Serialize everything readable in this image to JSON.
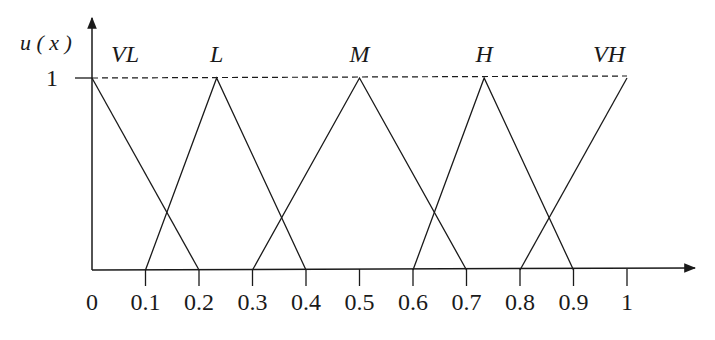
{
  "chart_data": {
    "type": "line",
    "title": "",
    "xlabel": "",
    "ylabel": "u ( x )",
    "xlim": [
      0,
      1
    ],
    "ylim": [
      0,
      1
    ],
    "grid": false,
    "legend": "none (labels placed above each peak)",
    "x_ticks": [
      "0",
      "0.1",
      "0.2",
      "0.3",
      "0.4",
      "0.5",
      "0.6",
      "0.7",
      "0.8",
      "0.9",
      "1"
    ],
    "y_ticks": [
      "1"
    ],
    "reference_line": {
      "y": 1,
      "style": "dashed",
      "x_range": [
        0,
        1
      ]
    },
    "series": [
      {
        "name": "VL",
        "x": [
          0,
          0.2
        ],
        "y": [
          1,
          0
        ]
      },
      {
        "name": "L",
        "x": [
          0.1,
          0.233,
          0.4
        ],
        "y": [
          0,
          1,
          0
        ]
      },
      {
        "name": "M",
        "x": [
          0.3,
          0.5,
          0.7
        ],
        "y": [
          0,
          1,
          0
        ]
      },
      {
        "name": "H",
        "x": [
          0.6,
          0.733,
          0.9
        ],
        "y": [
          0,
          1,
          0
        ]
      },
      {
        "name": "VH",
        "x": [
          0.8,
          1
        ],
        "y": [
          0,
          1
        ]
      }
    ]
  },
  "labels": {
    "y_axis": "u ( x )",
    "one": "1",
    "sets": [
      "VL",
      "L",
      "M",
      "H",
      "VH"
    ]
  }
}
